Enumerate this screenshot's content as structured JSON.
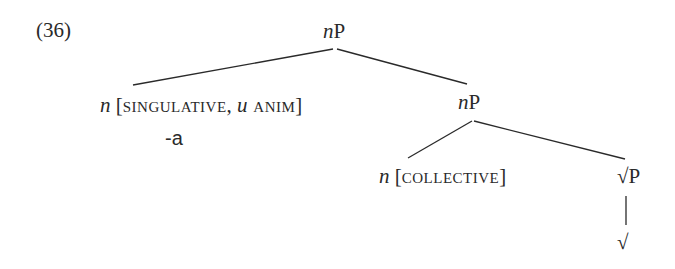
{
  "example": {
    "number": "(36)"
  },
  "tree": {
    "root": {
      "head": "n",
      "label": "P"
    },
    "left_daughter": {
      "head": "n",
      "open_bracket": " [",
      "feature1": "SINGULATIVE",
      "comma": ", ",
      "feature2_prefix": "u",
      "feature2": " ANIM",
      "close_bracket": "]",
      "exponent": "-a"
    },
    "right_daughter": {
      "head": "n",
      "label": "P"
    },
    "inner_left": {
      "head": "n",
      "open_bracket": " [",
      "feature": "COLLECTIVE",
      "close_bracket": "]"
    },
    "inner_right": {
      "label": "√P"
    },
    "terminal": {
      "label": "√"
    }
  },
  "colors": {
    "ink": "#2a2a2a",
    "background": "#ffffff"
  }
}
